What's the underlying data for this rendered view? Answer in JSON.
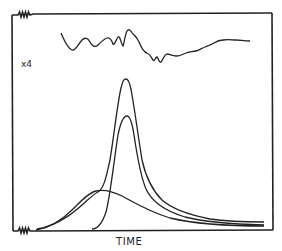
{
  "figure": {
    "type": "diagram",
    "labels": {
      "magnification": "x4",
      "x_axis": "TIME"
    },
    "colors": {
      "ink": "#222222",
      "background": "#ffffff"
    },
    "frame": {
      "left": 12,
      "top": 13,
      "right": 272,
      "bottom": 231
    },
    "traces": [
      {
        "name": "baseline-noise-x4",
        "description": "Amplified noisy baseline near top"
      },
      {
        "name": "composite-peak",
        "description": "Tall sharp peak sum of broad and narrow components",
        "peak_x": 126,
        "peak_y": 80
      },
      {
        "name": "narrow-peak",
        "description": "Narrower tall peak",
        "peak_x": 127,
        "peak_y": 115
      },
      {
        "name": "broad-peak",
        "description": "Low broad hump",
        "peak_x": 98,
        "peak_y": 190
      }
    ],
    "symbols": [
      {
        "name": "top-left-resistor",
        "description": "zigzag symbol on top edge near left corner"
      },
      {
        "name": "bottom-left-resistor",
        "description": "zigzag symbol on bottom edge near left corner"
      }
    ]
  }
}
